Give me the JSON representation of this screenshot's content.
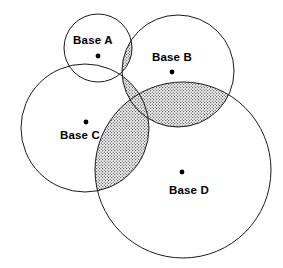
{
  "diagram": {
    "type": "venn-coverage",
    "canvas": {
      "width": 283,
      "height": 268,
      "background": "#ffffff"
    },
    "style": {
      "stroke_color": "#1a1a1a",
      "stroke_width": 1,
      "label_color": "#000000",
      "dot_color": "#000000",
      "shade_pattern": "stipple-dots",
      "shade_color": "#555555",
      "shade_background": "#ffffff"
    },
    "bases": [
      {
        "id": "base-a",
        "label": "Base A",
        "center": {
          "x": 98,
          "y": 48
        },
        "radius": 34,
        "dot": {
          "x": 98,
          "y": 56
        },
        "label_position": {
          "x": 93,
          "y": 41
        }
      },
      {
        "id": "base-b",
        "label": "Base B",
        "center": {
          "x": 178,
          "y": 71
        },
        "radius": 56,
        "dot": {
          "x": 172,
          "y": 72
        },
        "label_position": {
          "x": 172,
          "y": 58
        }
      },
      {
        "id": "base-c",
        "label": "Base C",
        "center": {
          "x": 85,
          "y": 128
        },
        "radius": 64,
        "dot": {
          "x": 86,
          "y": 122
        },
        "label_position": {
          "x": 80,
          "y": 136
        }
      },
      {
        "id": "base-d",
        "label": "Base D",
        "center": {
          "x": 183,
          "y": 170
        },
        "radius": 88,
        "dot": {
          "x": 182,
          "y": 172
        },
        "label_position": {
          "x": 189,
          "y": 191
        }
      }
    ],
    "shaded_regions": [
      {
        "id": "overlap-a-b",
        "bases": [
          "Base A",
          "Base B"
        ]
      },
      {
        "id": "overlap-b-c",
        "bases": [
          "Base B",
          "Base C"
        ]
      },
      {
        "id": "overlap-c-d",
        "bases": [
          "Base C",
          "Base D"
        ]
      },
      {
        "id": "overlap-b-d",
        "bases": [
          "Base B",
          "Base D"
        ]
      }
    ]
  }
}
